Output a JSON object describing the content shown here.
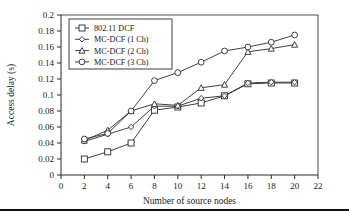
{
  "chart_data": {
    "type": "line",
    "title": "",
    "xlabel": "Number of source nodes",
    "ylabel": "Access delay (s)",
    "xlim": [
      0,
      22
    ],
    "ylim": [
      0,
      0.2
    ],
    "xticks": [
      0,
      2,
      4,
      6,
      8,
      10,
      12,
      14,
      16,
      18,
      20,
      22
    ],
    "xtick_labels": [
      "0",
      "2",
      "4",
      "6",
      "8",
      "10",
      "12",
      "14",
      "16",
      "18",
      "20",
      "22"
    ],
    "yticks": [
      0,
      0.02,
      0.04,
      0.06,
      0.08,
      0.1,
      0.12,
      0.14,
      0.16,
      0.18,
      0.2
    ],
    "ytick_labels": [
      "0",
      "0.02",
      "0.04",
      "0.06",
      "0.08",
      "0.1",
      "0.12",
      "0.14",
      "0.16",
      "0.18",
      "0.2"
    ],
    "grid": false,
    "legend_position": "upper left",
    "x": [
      2,
      4,
      6,
      8,
      10,
      12,
      14,
      16,
      18,
      20
    ],
    "series": [
      {
        "name": "802.11 DCF",
        "marker": "square",
        "color": "#2b2b2b",
        "values": [
          0.02,
          0.029,
          0.04,
          0.081,
          0.085,
          0.09,
          0.099,
          0.114,
          0.115,
          0.115
        ]
      },
      {
        "name": "MC-DCF (1 Ch)",
        "marker": "diamond",
        "color": "#2b2b2b",
        "values": [
          0.042,
          0.051,
          0.06,
          0.086,
          0.086,
          0.096,
          0.099,
          0.115,
          0.116,
          0.116
        ]
      },
      {
        "name": "MC-DCF (2 Ch)",
        "marker": "triangle",
        "color": "#2b2b2b",
        "values": [
          0.043,
          0.056,
          0.08,
          0.089,
          0.087,
          0.109,
          0.113,
          0.154,
          0.158,
          0.163
        ]
      },
      {
        "name": "MC-DCF (3 Ch)",
        "marker": "circle",
        "color": "#2b2b2b",
        "values": [
          0.045,
          0.052,
          0.08,
          0.118,
          0.128,
          0.141,
          0.155,
          0.16,
          0.166,
          0.175
        ]
      }
    ]
  },
  "legend": {
    "entries": [
      {
        "label": "802.11 DCF"
      },
      {
        "label": "MC-DCF (1 Ch)"
      },
      {
        "label": "MC-DCF (2 Ch)"
      },
      {
        "label": "MC-DCF (3 Ch)"
      }
    ]
  },
  "colors": {
    "ink": "#2b2b2b",
    "background": "#ffffff",
    "rule": "#111111"
  }
}
